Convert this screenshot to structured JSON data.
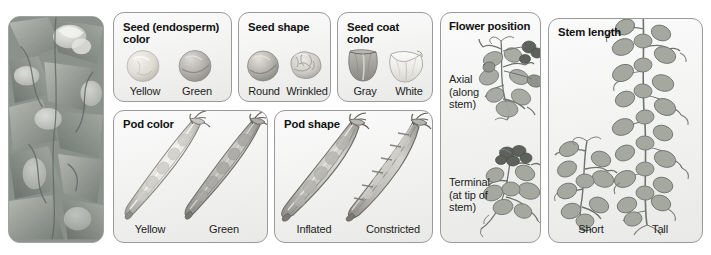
{
  "figure": {
    "caption_present": false,
    "panels": [
      {
        "id": "photograph",
        "title": "",
        "kind": "photograph",
        "subject": "pea-plant-flowers-photo"
      },
      {
        "id": "seed-color",
        "title": "Seed (endosperm) color",
        "title_line1": "Seed (endosperm)",
        "title_line2": "color",
        "variants": [
          {
            "label": "Yellow",
            "icon": "pea-seed-round-light-icon"
          },
          {
            "label": "Green",
            "icon": "pea-seed-round-dark-icon"
          }
        ]
      },
      {
        "id": "seed-shape",
        "title": "Seed shape",
        "title_line1": "Seed shape",
        "title_line2": "",
        "variants": [
          {
            "label": "Round",
            "icon": "pea-seed-smooth-icon"
          },
          {
            "label": "Wrinkled",
            "icon": "pea-seed-wrinkled-icon"
          }
        ]
      },
      {
        "id": "seed-coat-color",
        "title": "Seed coat color",
        "title_line1": "Seed coat",
        "title_line2": "color",
        "variants": [
          {
            "label": "Gray",
            "icon": "seed-coat-gray-icon"
          },
          {
            "label": "White",
            "icon": "seed-coat-white-icon"
          }
        ]
      },
      {
        "id": "pod-color",
        "title": "Pod color",
        "title_line1": "Pod color",
        "title_line2": "",
        "variants": [
          {
            "label": "Yellow",
            "icon": "pea-pod-light-icon"
          },
          {
            "label": "Green",
            "icon": "pea-pod-dark-icon"
          }
        ]
      },
      {
        "id": "pod-shape",
        "title": "Pod shape",
        "title_line1": "Pod shape",
        "title_line2": "",
        "variants": [
          {
            "label": "Inflated",
            "icon": "pea-pod-inflated-icon"
          },
          {
            "label": "Constricted",
            "icon": "pea-pod-constricted-icon"
          }
        ]
      },
      {
        "id": "flower-position",
        "title": "Flower position",
        "title_line1": "Flower position",
        "title_line2": "",
        "variants": [
          {
            "label": "Axial\n(along\nstem)",
            "icon": "pea-plant-axial-flowers-icon"
          },
          {
            "label": "Terminal\n(at tip of\nstem)",
            "icon": "pea-plant-terminal-flowers-icon"
          }
        ]
      },
      {
        "id": "stem-length",
        "title": "Stem length",
        "title_line1": "Stem length",
        "title_line2": "",
        "variants": [
          {
            "label": "Short",
            "icon": "pea-plant-short-icon"
          },
          {
            "label": "Tall",
            "icon": "pea-plant-tall-icon"
          }
        ]
      }
    ]
  },
  "colors": {
    "page_background": "#ffffff",
    "panel_border": "#9a9a9a",
    "panel_fill_top": "#fbfbfb",
    "panel_fill_bottom": "#e9e9e7",
    "title_text": "#111111",
    "label_text": "#1d1d1d",
    "seed_light": "#d9d7d2",
    "seed_dark": "#a9a8a3",
    "pod_light": "#cfcdc8",
    "pod_dark": "#a8a7a2",
    "plant_green_gray": "#9ea29a",
    "photo_base": "#8e9490"
  }
}
